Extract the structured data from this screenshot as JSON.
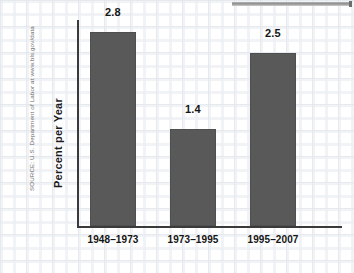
{
  "chart_data": {
    "type": "bar",
    "title": "",
    "xlabel": "",
    "ylabel": "Percent per Year",
    "categories": [
      "1948–1973",
      "1973–1995",
      "1995–2007"
    ],
    "values": [
      2.8,
      1.4,
      2.5
    ],
    "value_labels": [
      "2.8",
      "1.4",
      "2.5"
    ],
    "ylim": [
      0,
      3.0
    ],
    "grid": false,
    "legend": null,
    "series": [
      {
        "name": "Productivity growth",
        "values": [
          2.8,
          1.4,
          2.5
        ]
      }
    ],
    "bar_color": "#595959",
    "axis_color": "#3a3a3a"
  },
  "annotations": {
    "source_note": "SOURCE: U.S. Department of Labor at www.bls.gov/data"
  }
}
